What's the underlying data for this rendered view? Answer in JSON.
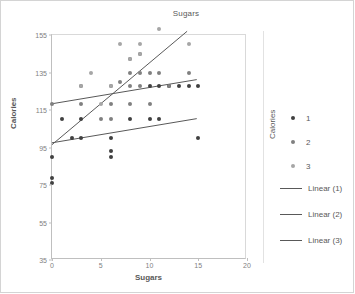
{
  "chart_data": {
    "type": "scatter",
    "title": "Sugars",
    "xlabel": "Sugars",
    "ylabel": "Calories",
    "legend_title": "Calories",
    "legend_position": "right",
    "grid": false,
    "xlim": [
      0,
      20
    ],
    "ylim": [
      35,
      155
    ],
    "xticks": [
      0,
      5,
      10,
      15,
      20
    ],
    "yticks": [
      35,
      55,
      75,
      95,
      115,
      135,
      155
    ],
    "colors": {
      "series1": "#404040",
      "series2": "#808080",
      "series3": "#a6a6a6"
    },
    "series": [
      {
        "name": "1",
        "marker": "circle",
        "points": [
          [
            0,
            90
          ],
          [
            0,
            79
          ],
          [
            0,
            76
          ],
          [
            1,
            110
          ],
          [
            2,
            100
          ],
          [
            3,
            100
          ],
          [
            3,
            110
          ],
          [
            6,
            100
          ],
          [
            6,
            93
          ],
          [
            6,
            90
          ],
          [
            8,
            110
          ],
          [
            10,
            110
          ],
          [
            10,
            128
          ],
          [
            11,
            110
          ],
          [
            11,
            128
          ],
          [
            12,
            128
          ],
          [
            13,
            128
          ],
          [
            14,
            128
          ],
          [
            15,
            128
          ],
          [
            15,
            100
          ]
        ]
      },
      {
        "name": "2",
        "marker": "circle",
        "points": [
          [
            0,
            118
          ],
          [
            3,
            118
          ],
          [
            3,
            128
          ],
          [
            5,
            110
          ],
          [
            6,
            110
          ],
          [
            6,
            118
          ],
          [
            6,
            128
          ],
          [
            7,
            130
          ],
          [
            8,
            118
          ],
          [
            8,
            128
          ],
          [
            8,
            135
          ],
          [
            8,
            142
          ],
          [
            9,
            128
          ],
          [
            9,
            135
          ],
          [
            9,
            145
          ],
          [
            10,
            135
          ],
          [
            10,
            118
          ],
          [
            11,
            135
          ],
          [
            12,
            128
          ],
          [
            14,
            135
          ]
        ]
      },
      {
        "name": "3",
        "marker": "circle",
        "points": [
          [
            4,
            135
          ],
          [
            7,
            150
          ],
          [
            9,
            150
          ],
          [
            11,
            158
          ],
          [
            14,
            150
          ],
          [
            8,
            142
          ],
          [
            9,
            145
          ],
          [
            6,
            128
          ],
          [
            3,
            128
          ],
          [
            5,
            118
          ]
        ]
      }
    ],
    "trendlines": [
      {
        "name": "Linear (1)",
        "x0": 0,
        "y0": 97,
        "x1": 15,
        "y1": 110
      },
      {
        "name": "Linear (2)",
        "x0": 0,
        "y0": 118,
        "x1": 15,
        "y1": 131
      },
      {
        "name": "Linear (3)",
        "x0": 0,
        "y0": 96,
        "x1": 14,
        "y1": 157
      }
    ],
    "legend_items": [
      {
        "label": "1",
        "type": "marker",
        "color": "#404040"
      },
      {
        "label": "2",
        "type": "marker",
        "color": "#808080"
      },
      {
        "label": "3",
        "type": "marker",
        "color": "#a6a6a6"
      },
      {
        "label": "Linear (1)",
        "type": "line",
        "color": "#595959"
      },
      {
        "label": "Linear (2)",
        "type": "line",
        "color": "#595959"
      },
      {
        "label": "Linear (3)",
        "type": "line",
        "color": "#595959"
      }
    ]
  }
}
